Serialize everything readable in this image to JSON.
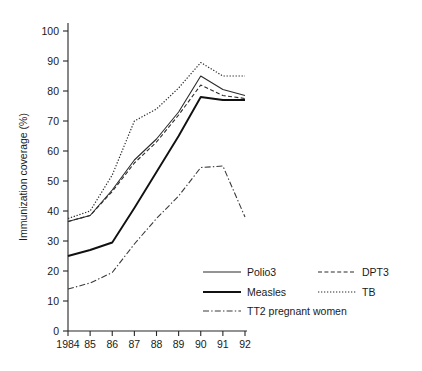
{
  "chart_data": {
    "type": "line",
    "title": "",
    "xlabel": "",
    "ylabel": "Immunization coverage (%)",
    "x": [
      1984,
      1985,
      1986,
      1987,
      1988,
      1989,
      1990,
      1991,
      1992
    ],
    "xtick_labels": [
      "1984",
      "85",
      "86",
      "87",
      "88",
      "89",
      "90",
      "91",
      "92"
    ],
    "ytick_labels": [
      "0",
      "10",
      "20",
      "30",
      "40",
      "50",
      "60",
      "70",
      "80",
      "90",
      "100"
    ],
    "ytick_values": [
      0,
      10,
      20,
      30,
      40,
      50,
      60,
      70,
      80,
      90,
      100
    ],
    "ylim": [
      0,
      100
    ],
    "xlim": [
      1984,
      1992
    ],
    "grid": false,
    "legend_position": "inside-lower-right",
    "series": [
      {
        "name": "Polio3",
        "style": "solid-thin",
        "color": "#2b2b2b",
        "values": [
          36.5,
          38.5,
          47,
          57,
          64,
          73,
          85,
          80.5,
          78.5
        ]
      },
      {
        "name": "DPT3",
        "style": "dashed",
        "color": "#2b2b2b",
        "values": [
          36.5,
          38.5,
          46.5,
          56,
          63,
          72,
          82,
          78.5,
          77.5
        ]
      },
      {
        "name": "Measles",
        "style": "solid-thick",
        "color": "#111111",
        "values": [
          25,
          27,
          29.5,
          41,
          53,
          65,
          78,
          77,
          77
        ]
      },
      {
        "name": "TB",
        "style": "dotted",
        "color": "#2b2b2b",
        "values": [
          37.5,
          40,
          52,
          70,
          74,
          81,
          89.5,
          85,
          85
        ]
      },
      {
        "name": "TT2 pregnant women",
        "style": "dash-dot",
        "color": "#3a3a3a",
        "values": [
          14,
          16,
          19.5,
          29,
          37.5,
          45,
          54.5,
          55,
          38
        ]
      }
    ]
  },
  "legend": {
    "entries": [
      {
        "key": "polio3",
        "label": "Polio3"
      },
      {
        "key": "dpt3",
        "label": "DPT3"
      },
      {
        "key": "measles",
        "label": "Measles"
      },
      {
        "key": "tb",
        "label": "TB"
      },
      {
        "key": "tt2",
        "label": "TT2 pregnant women"
      }
    ]
  }
}
